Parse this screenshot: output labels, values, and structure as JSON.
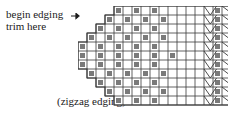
{
  "diagram": {
    "caption": "(zigzag edging)",
    "annotations": {
      "begin_line1": "begin edging",
      "begin_line2": "trim here",
      "row_top": "row 11",
      "row_bottom": "row 1"
    },
    "arrow_icon": "arrow-right-icon"
  },
  "chart_data": {
    "type": "heatmap",
    "title": "(zigzag edging)",
    "xlabel": "",
    "ylabel": "",
    "grid": true,
    "legend_position": "none",
    "cell_px": 9,
    "rows": 11,
    "cols": 22,
    "row_labels": [
      "row 11",
      "row 10",
      "row 9",
      "row 8",
      "row 7",
      "row 6",
      "row 5",
      "row 4",
      "row 3",
      "row 2",
      "row 1"
    ],
    "colors": {
      "marked_cell": "#7a7a7a",
      "grid_line": "#3a3a3a",
      "background": "#ffffff",
      "chevron_stroke": "#3a3a3a",
      "text": "#1a1a1a"
    },
    "sections": {
      "lattice": {
        "col_start": 0,
        "col_end": 14,
        "description": "stepped diagonal lattice of marked cells"
      },
      "zigzag": {
        "col_start": 14,
        "col_end": 22,
        "description": "chevron columns alternating with solid marked columns"
      }
    },
    "marked_cells": [
      [
        0,
        0
      ],
      [
        0,
        2
      ],
      [
        1,
        1
      ],
      [
        1,
        3
      ],
      [
        2,
        0
      ],
      [
        2,
        2
      ],
      [
        2,
        4
      ],
      [
        3,
        1
      ],
      [
        3,
        3
      ],
      [
        3,
        5
      ],
      [
        4,
        0
      ],
      [
        4,
        2
      ],
      [
        4,
        4
      ],
      [
        4,
        6
      ],
      [
        5,
        1
      ],
      [
        5,
        3
      ],
      [
        5,
        5
      ],
      [
        5,
        7
      ],
      [
        6,
        0
      ],
      [
        6,
        2
      ],
      [
        6,
        4
      ],
      [
        6,
        6
      ],
      [
        7,
        1
      ],
      [
        7,
        3
      ],
      [
        7,
        5
      ],
      [
        8,
        0
      ],
      [
        8,
        2
      ],
      [
        8,
        4
      ],
      [
        9,
        1
      ],
      [
        9,
        3
      ],
      [
        10,
        0
      ],
      [
        10,
        2
      ]
    ],
    "solid_columns": [
      15,
      21
    ],
    "chevron_columns": [
      14,
      16,
      17,
      18,
      19,
      20
    ],
    "outline_steps": [
      {
        "row": 0,
        "left_col": 0
      },
      {
        "row": 1,
        "left_col": 0
      },
      {
        "row": 2,
        "left_col": 0
      },
      {
        "row": 3,
        "left_col": 0
      },
      {
        "row": 4,
        "left_col": 0
      },
      {
        "row": 5,
        "left_col": 0
      },
      {
        "row": 6,
        "left_col": 0
      },
      {
        "row": 7,
        "left_col": 0
      },
      {
        "row": 8,
        "left_col": 0
      },
      {
        "row": 9,
        "left_col": 0
      },
      {
        "row": 10,
        "left_col": 0
      }
    ]
  }
}
